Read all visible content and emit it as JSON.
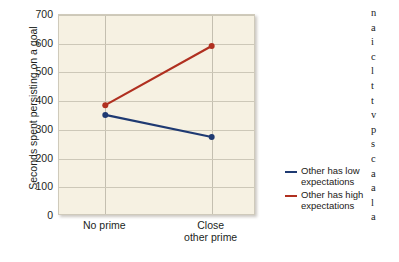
{
  "chart_data": {
    "type": "line",
    "title": "",
    "xlabel": "",
    "ylabel": "Seconds spent persisting on a goal",
    "categories": [
      "No prime",
      "Close other prime"
    ],
    "ylim": [
      0,
      700
    ],
    "yticks": [
      0,
      100,
      200,
      300,
      400,
      500,
      600,
      700
    ],
    "ytick_labels": [
      "0",
      "100",
      "200",
      "300",
      "400",
      "500",
      "600",
      "700"
    ],
    "grid": true,
    "legend_position": "right",
    "series": [
      {
        "name": "Other has low expectations",
        "color": "#1f3a72",
        "values": [
          352,
          275
        ]
      },
      {
        "name": "Other has high expectations",
        "color": "#b03020",
        "values": [
          386,
          592
        ]
      }
    ],
    "xtick_labels": [
      {
        "line1": "No prime",
        "line2": ""
      },
      {
        "line1": "Close",
        "line2": "other prime"
      }
    ]
  },
  "legend": {
    "items": [
      {
        "label_line1": "Other has low",
        "label_line2": "expectations",
        "color": "#1f3a72"
      },
      {
        "label_line1": "Other has high",
        "label_line2": "expectations",
        "color": "#b03020"
      }
    ]
  },
  "side_text": {
    "lines": [
      "n",
      "a",
      "i",
      "c",
      "l",
      "t",
      "t",
      "v",
      "p",
      "s",
      "c",
      "a",
      "a",
      "l",
      "a"
    ]
  },
  "colors": {
    "plot_background": "#f6f1e2",
    "gridline": "#cdc8b8",
    "series_low": "#1f3a72",
    "series_high": "#b03020",
    "text": "#221f1c"
  }
}
